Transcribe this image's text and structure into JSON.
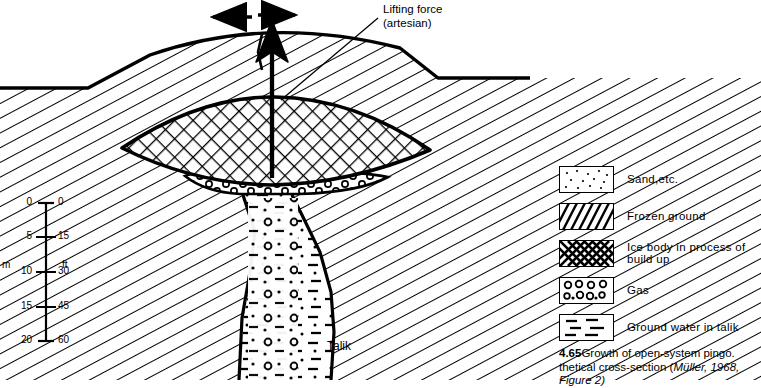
{
  "figure": {
    "annotations": {
      "lifting_force_line1": "Lifting force",
      "lifting_force_line2": "(artesian)",
      "talik": "Talik"
    },
    "scale_bar": {
      "left_unit": "m",
      "right_unit": "ft",
      "meters_ticks": [
        "0",
        "5",
        "10",
        "15",
        "20"
      ],
      "feet_ticks": [
        "0",
        "15",
        "30",
        "45",
        "60"
      ]
    },
    "legend": [
      {
        "icon": "sand-dots-swatch",
        "label": "Sand,etc."
      },
      {
        "icon": "diagonal-hatch-swatch",
        "label": "Frozen ground"
      },
      {
        "icon": "cross-hatch-swatch",
        "label": "Ice body in process of build up"
      },
      {
        "icon": "circles-swatch",
        "label": "Gas"
      },
      {
        "icon": "dashes-swatch",
        "label": "Ground water in talik"
      }
    ],
    "caption": {
      "number": "4.65",
      "text_part1": "Growth of open-system pingo. ",
      "text_part2": "thetical cross-section (",
      "source": "Müller, 1968,",
      "text_part3": "Figure 2)"
    },
    "colors": {
      "ink": "#000000",
      "paper": "#ffffff"
    }
  }
}
